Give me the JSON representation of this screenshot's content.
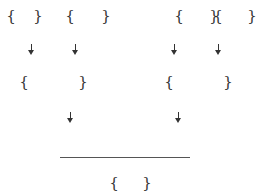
{
  "diagram": {
    "type": "derivation-tree",
    "level1": [
      {
        "open": "{",
        "close": "}",
        "ox": 11,
        "cx": 38,
        "y": 16
      },
      {
        "open": "{",
        "close": "}",
        "ox": 70,
        "cx": 106,
        "y": 16
      },
      {
        "open": "{",
        "close": "}",
        "ox": 179,
        "cx": 214,
        "y": 16
      },
      {
        "open": "{",
        "close": "}",
        "ox": 218,
        "cx": 252,
        "y": 16
      }
    ],
    "arrows1": [
      {
        "x": 31,
        "y": 44
      },
      {
        "x": 75,
        "y": 44
      },
      {
        "x": 174,
        "y": 44
      },
      {
        "x": 218,
        "y": 44
      }
    ],
    "level2": [
      {
        "open": "{",
        "close": "}",
        "ox": 24,
        "cx": 83,
        "y": 82
      },
      {
        "open": "{",
        "close": "}",
        "ox": 169,
        "cx": 228,
        "y": 82
      }
    ],
    "arrows2": [
      {
        "x": 70,
        "y": 112
      },
      {
        "x": 178,
        "y": 112
      }
    ],
    "rule": {
      "x1": 60,
      "x2": 190,
      "y": 157
    },
    "result": {
      "open": "{",
      "close": "}",
      "ox": 114,
      "cx": 147,
      "y": 183
    }
  }
}
